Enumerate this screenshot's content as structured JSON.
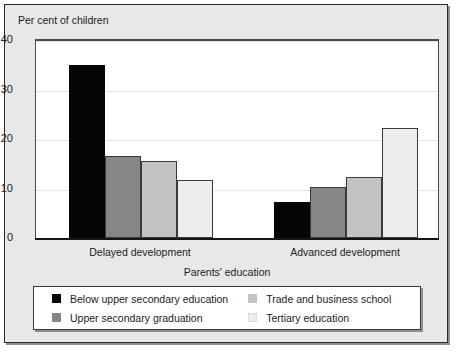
{
  "chart_data": {
    "type": "bar",
    "title": "",
    "ylabel": "Per cent of children",
    "xlabel": "Parents' education",
    "categories": [
      "Delayed development",
      "Advanced  development"
    ],
    "series": [
      {
        "name": "Below upper secondary education",
        "color": "#050505",
        "values": [
          35.0,
          7.3
        ]
      },
      {
        "name": "Upper secondary graduation",
        "color": "#868686",
        "values": [
          16.5,
          10.4
        ]
      },
      {
        "name": "Trade and business school",
        "color": "#c3c3c3",
        "values": [
          15.5,
          12.3
        ]
      },
      {
        "name": "Tertiary education",
        "color": "#ededed",
        "values": [
          11.7,
          22.3
        ]
      }
    ],
    "ylim": [
      0,
      40
    ],
    "yticks": [
      0,
      10,
      20,
      30,
      40
    ],
    "ytick_labels": [
      "0",
      "10",
      "20",
      "30",
      "40"
    ],
    "grid": true,
    "legend_position": "bottom"
  },
  "legend": {
    "items": [
      {
        "label": "Below upper secondary education",
        "swatch": "black-swatch"
      },
      {
        "label": "Upper secondary graduation",
        "swatch": "dark-gray-swatch"
      },
      {
        "label": "Trade and business school",
        "swatch": "light-gray-swatch"
      },
      {
        "label": "Tertiary education",
        "swatch": "very-light-gray-swatch"
      }
    ]
  }
}
